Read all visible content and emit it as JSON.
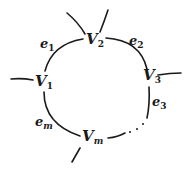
{
  "diagram": {
    "type": "cycle-graph",
    "vertices": [
      {
        "id": "V1",
        "base": "V",
        "sub": "1"
      },
      {
        "id": "V2",
        "base": "V",
        "sub": "2"
      },
      {
        "id": "V3",
        "base": "V",
        "sub": "3"
      },
      {
        "id": "Vm",
        "base": "V",
        "sub": "m"
      }
    ],
    "edges": [
      {
        "id": "e1",
        "base": "e",
        "sub": "1",
        "from": "V1",
        "to": "V2"
      },
      {
        "id": "e2",
        "base": "e",
        "sub": "2",
        "from": "V2",
        "to": "V3"
      },
      {
        "id": "e3",
        "base": "e",
        "sub": "3",
        "from": "V3",
        "to": "..."
      },
      {
        "id": "em",
        "base": "e",
        "sub": "m",
        "from": "Vm",
        "to": "V1"
      }
    ],
    "ellipsis": "…",
    "stroke_color": "#1a1a1a",
    "background": "#ffffff"
  }
}
